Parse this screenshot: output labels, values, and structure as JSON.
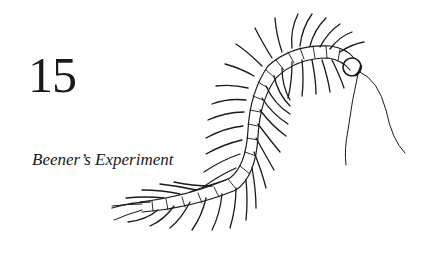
{
  "chapter": {
    "number": "15",
    "title": "Beener’s Experiment"
  },
  "illustration": {
    "subject": "centipede-drawing",
    "ink_color": "#1a1a1a"
  }
}
